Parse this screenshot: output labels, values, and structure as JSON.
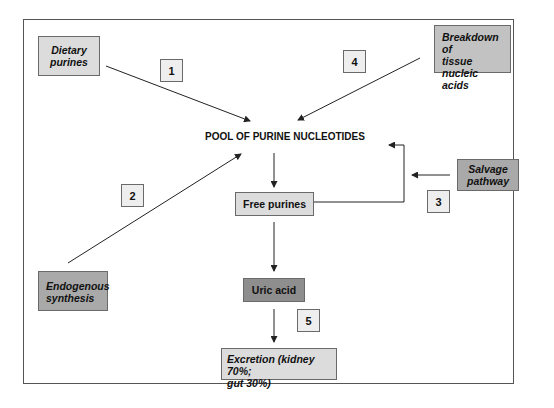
{
  "diagram": {
    "title": "POOL OF PURINE NUCLEOTIDES",
    "sources": {
      "dietary": "Dietary purines",
      "dietary_line1": "Dietary",
      "dietary_line2": "purines",
      "breakdown_line1": "Breakdown of",
      "breakdown_line2": "tissue nucleic",
      "breakdown_line3": "acids",
      "endogenous_line1": "Endogenous",
      "endogenous_line2": "synthesis",
      "salvage_line1": "Salvage",
      "salvage_line2": "pathway"
    },
    "nodes": {
      "free_purines": "Free purines",
      "uric_acid": "Uric acid",
      "excretion_line1": "Excretion (kidney 70%;",
      "excretion_line2": "gut 30%)"
    },
    "step_numbers": [
      "1",
      "2",
      "3",
      "4",
      "5"
    ],
    "colors": {
      "light_box": "#dcdcdc",
      "mid_box": "#c2c2c2",
      "dark_box": "#a9a9a9",
      "uric_box": "#8e8e8e",
      "number_box": "#eeeeee",
      "line": "#222222"
    }
  }
}
